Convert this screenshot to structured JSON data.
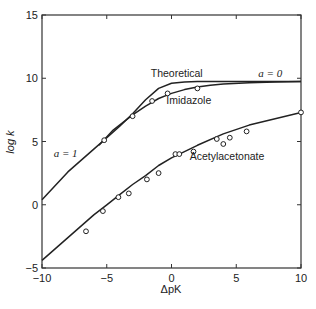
{
  "chart_data": {
    "type": "line",
    "title": "",
    "xlabel": "ΔpK",
    "ylabel": "log k",
    "xlim": [
      -10,
      10
    ],
    "ylim": [
      -5,
      15
    ],
    "x_ticks": [
      -10,
      -5,
      0,
      5,
      10
    ],
    "y_ticks": [
      -5,
      0,
      5,
      10,
      15
    ],
    "x_tick_labels": [
      "−10",
      "−5",
      "0",
      "5",
      "10"
    ],
    "y_tick_labels": [
      "−5",
      "0",
      "5",
      "10",
      "15"
    ],
    "grid": false,
    "legend": null,
    "annotations": [
      {
        "text": "Theoretical",
        "x": -1.6,
        "y": 10.1
      },
      {
        "text": "Imidazole",
        "x": -0.4,
        "y": 8.0
      },
      {
        "text": "Acetylacetonate",
        "x": 1.4,
        "y": 3.5
      },
      {
        "text": "a = 1",
        "x": -9.1,
        "y": 3.8
      },
      {
        "text": "a = 0",
        "x": 6.7,
        "y": 10.1
      }
    ],
    "series": [
      {
        "name": "Theoretical",
        "kind": "curve",
        "x": [
          -10,
          -8,
          -6,
          -5,
          -4,
          -3,
          -2,
          -1,
          0,
          1,
          2,
          4,
          6,
          8,
          10
        ],
        "y": [
          0.4,
          2.6,
          4.4,
          5.3,
          6.2,
          7.2,
          8.3,
          9.2,
          9.6,
          9.7,
          9.75,
          9.75,
          9.75,
          9.75,
          9.75
        ]
      },
      {
        "name": "Imidazole",
        "kind": "curve",
        "x": [
          -5.6,
          -4.5,
          -3,
          -2,
          -1.5,
          -1,
          0,
          1,
          2,
          3,
          4,
          6,
          8,
          10
        ],
        "y": [
          4.7,
          5.9,
          7.1,
          7.8,
          8.1,
          8.4,
          8.8,
          9.1,
          9.3,
          9.45,
          9.55,
          9.65,
          9.7,
          9.75
        ]
      },
      {
        "name": "Imidazole (observed)",
        "kind": "points",
        "x": [
          -5.2,
          -3.0,
          -1.5,
          -0.3,
          2.0
        ],
        "y": [
          5.1,
          7.0,
          8.2,
          8.8,
          9.2
        ]
      },
      {
        "name": "Acetylacetonate",
        "kind": "curve",
        "x": [
          -10,
          -8,
          -6,
          -5,
          -4,
          -3,
          -2,
          -1,
          0,
          1,
          2,
          4,
          6,
          8,
          10
        ],
        "y": [
          -4.4,
          -2.6,
          -0.8,
          0.0,
          0.8,
          1.6,
          2.3,
          3.1,
          3.7,
          4.2,
          4.7,
          5.6,
          6.3,
          6.8,
          7.3
        ]
      },
      {
        "name": "Acetylacetonate (observed)",
        "kind": "points",
        "x": [
          -6.6,
          -5.3,
          -4.1,
          -3.3,
          -1.9,
          -1.0,
          0.3,
          0.6,
          1.7,
          3.5,
          4.0,
          4.5,
          5.8,
          10.0
        ],
        "y": [
          -2.1,
          -0.5,
          0.6,
          0.9,
          2.0,
          2.5,
          4.0,
          4.0,
          4.2,
          5.2,
          4.8,
          5.3,
          5.8,
          7.3
        ]
      }
    ]
  }
}
